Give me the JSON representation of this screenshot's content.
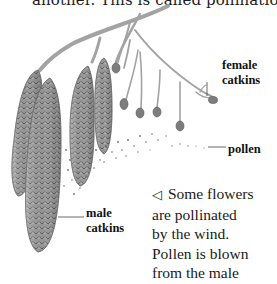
{
  "page": {
    "top_text": "another. This is called pollination."
  },
  "illustration": {
    "subject": "alder branch with male and female catkins releasing pollen",
    "labels": {
      "female_catkins_line1": "female",
      "female_catkins_line2": "catkins",
      "pollen": "pollen",
      "male_catkins_line1": "male",
      "male_catkins_line2": "catkins"
    }
  },
  "caption": {
    "pointer_icon": "left-triangle-icon",
    "pointer_glyph": "◁",
    "lines": [
      "Some flowers",
      "are pollinated",
      "by the wind.",
      "Pollen is blown",
      "from the male"
    ]
  },
  "colors": {
    "text": "#1a1a1a",
    "catkin": "#8a8a8a",
    "branch": "#9a9a9a",
    "background": "#ffffff"
  }
}
